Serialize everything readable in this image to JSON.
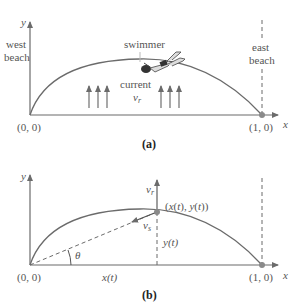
{
  "panel_a": {
    "caption": "(a)",
    "y_axis_label": "y",
    "x_axis_label": "x",
    "west_beach_line1": "west",
    "west_beach_line2": "beach",
    "east_beach_line1": "east",
    "east_beach_line2": "beach",
    "swimmer_label": "swimmer",
    "current_label": "current",
    "current_symbol": "v",
    "current_subscript": "r",
    "origin_label": "(0, 0)",
    "end_label": "(1, 0)"
  },
  "panel_b": {
    "caption": "(b)",
    "y_axis_label": "y",
    "x_axis_label": "x",
    "origin_label": "(0, 0)",
    "end_label": "(1, 0)",
    "point_label": "(x(t), y(t))",
    "vr_symbol": "v",
    "vr_subscript": "r",
    "vs_symbol": "v",
    "vs_subscript": "s",
    "yt_label": "y(t)",
    "xt_label": "x(t)",
    "theta_label": "θ"
  },
  "colors": {
    "line": "#6b6b6b",
    "point": "#8a8a8a",
    "text": "#555555"
  }
}
